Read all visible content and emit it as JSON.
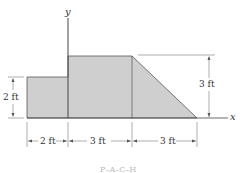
{
  "figure": {
    "axes": {
      "x_label": "x",
      "y_label": "y"
    },
    "shape_colors": {
      "fill": "#cfcfcf",
      "stroke": "#555555",
      "dim_line": "#777777"
    },
    "dimensions": {
      "left_height": "2 ft",
      "right_height": "3 ft",
      "bottom_1": "2 ft",
      "bottom_2": "3 ft",
      "bottom_3": "3 ft"
    },
    "caption": "P–A–C–H"
  }
}
